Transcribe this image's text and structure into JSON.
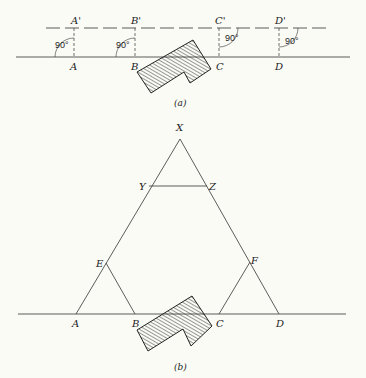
{
  "figure_a": {
    "caption": "(a)",
    "base_points": [
      "A",
      "B",
      "C",
      "D"
    ],
    "offset_points": [
      "A'",
      "B'",
      "C'",
      "D'"
    ],
    "angles": [
      "90°",
      "90°",
      "90°",
      "90°"
    ],
    "obstacle": "hatched L-shaped building between B and C"
  },
  "figure_b": {
    "caption": "(b)",
    "apex": "X",
    "top_points": [
      "Y",
      "Z"
    ],
    "side_points": [
      "E",
      "F"
    ],
    "base_points": [
      "A",
      "B",
      "C",
      "D"
    ],
    "obstacle": "hatched L-shaped building between B and C"
  },
  "colors": {
    "line": "#333333",
    "background": "#fbfbf6"
  }
}
